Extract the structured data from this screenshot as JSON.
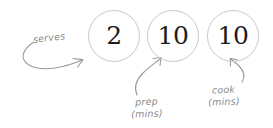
{
  "canvas": {
    "width": 273,
    "height": 128,
    "background": "#ffffff"
  },
  "theme": {
    "circle_border_color": "#c9c9c9",
    "value_text_color": "#1c1c1c",
    "annotation_color": "#8a8a8a",
    "arrow_color": "#9a9a9a"
  },
  "stats": [
    {
      "id": "serves",
      "value": "2",
      "label_lines": [
        "serves"
      ],
      "annotation_text": "serves"
    },
    {
      "id": "prep",
      "value": "10",
      "label_lines": [
        "prep",
        "(mins)"
      ],
      "annotation_text": "prep (mins)"
    },
    {
      "id": "cook",
      "value": "10",
      "label_lines": [
        "cook",
        "(mins)"
      ],
      "annotation_text": "cook (mins)"
    }
  ],
  "icons": {
    "arrow_serves": "curved-arrow-icon",
    "arrow_prep": "curved-arrow-icon",
    "arrow_cook": "curved-arrow-icon"
  }
}
